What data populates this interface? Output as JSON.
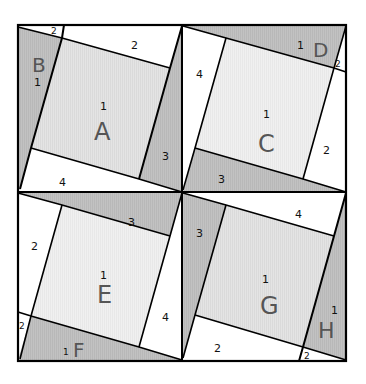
{
  "diagram": {
    "colors": {
      "shaded": "#bdbdbd",
      "square_light": "#e6e6e6",
      "square_lighter": "#f0f0f0",
      "white": "#ffffff",
      "line": "#000000",
      "big_label": "#555555"
    },
    "quadrants": {
      "top_left": {
        "square_label": "A",
        "square_num": "1",
        "triangle_label": "B",
        "triangle_num": "1",
        "small_2": "2",
        "side_top": "2",
        "side_right": "3",
        "side_bottom": "4"
      },
      "top_right": {
        "square_label": "C",
        "square_num": "1",
        "triangle_label": "D",
        "triangle_num": "1",
        "small_2": "2",
        "side_left": "4",
        "side_right": "2",
        "side_bottom": "3"
      },
      "bottom_left": {
        "square_label": "E",
        "square_num": "1",
        "triangle_label": "F",
        "triangle_num": "1",
        "small_2": "2",
        "side_left": "2",
        "side_top": "3",
        "side_right": "4"
      },
      "bottom_right": {
        "square_label": "G",
        "square_num": "1",
        "triangle_label": "H",
        "triangle_num": "1",
        "small_2": "2",
        "side_left": "3",
        "side_top": "4",
        "side_bottom": "2"
      }
    }
  }
}
